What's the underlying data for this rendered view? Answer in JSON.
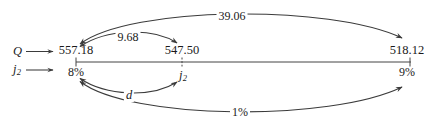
{
  "diagram": {
    "type": "interpolation-arrow-diagram",
    "row_labels": [
      {
        "name": "row-label-Q",
        "symbol": "Q",
        "subscript": ""
      },
      {
        "name": "row-label-j2",
        "symbol": "j",
        "subscript": "2"
      }
    ],
    "axis": {
      "label": "horizontal-number-line",
      "ticks": 3,
      "color": "#444444"
    },
    "nodes": [
      {
        "name": "node-left",
        "top_value": "557.18",
        "bottom_value": "8%",
        "x": 76
      },
      {
        "name": "node-middle",
        "top_value": "547.50",
        "bottom_value": "j",
        "bottom_subscript": "2",
        "x": 182
      },
      {
        "name": "node-right",
        "top_value": "518.12",
        "bottom_value": "9%",
        "x": 410
      }
    ],
    "arc_labels": [
      {
        "name": "arc-label-total-price-difference",
        "text": "39.06",
        "position": "top-outer"
      },
      {
        "name": "arc-label-partial-price-difference",
        "text": "9.68",
        "position": "top-inner"
      },
      {
        "name": "arc-label-yield-difference",
        "text": "d",
        "italic": true,
        "position": "bottom-inner"
      },
      {
        "name": "arc-label-total-yield-difference",
        "text": "1%",
        "position": "bottom-outer"
      }
    ],
    "colors": {
      "ink": "#1a1a1a",
      "stroke": "#3b3b3b",
      "axis": "#444444",
      "background": "#ffffff"
    }
  }
}
